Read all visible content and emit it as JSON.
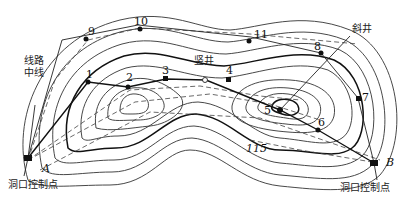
{
  "diagram": {
    "type": "topographic tunnel control survey",
    "labels": {
      "route_centerline": [
        "线路",
        "中线"
      ],
      "inclined_shaft": "斜井",
      "vertical_shaft": "竖井",
      "portal_control_point_left": "洞口控制点",
      "portal_control_point_right": "洞口控制点",
      "contour_elevation": "115"
    },
    "portal_points": [
      {
        "id": "A",
        "label": "A"
      },
      {
        "id": "B",
        "label": "B"
      }
    ],
    "control_points": [
      {
        "id": "1",
        "label": "1"
      },
      {
        "id": "2",
        "label": "2"
      },
      {
        "id": "3",
        "label": "3"
      },
      {
        "id": "4",
        "label": "4"
      },
      {
        "id": "5",
        "label": "5"
      },
      {
        "id": "6",
        "label": "6"
      },
      {
        "id": "7",
        "label": "7"
      },
      {
        "id": "8",
        "label": "8"
      },
      {
        "id": "9",
        "label": "9"
      },
      {
        "id": "10",
        "label": "10"
      },
      {
        "id": "11",
        "label": "11"
      }
    ],
    "traverse_main": [
      "A",
      "1",
      "2",
      "3",
      "4",
      "5",
      "6",
      "B"
    ],
    "traverse_outer": [
      "A",
      "9",
      "10",
      "11",
      "8",
      "7",
      "B"
    ]
  }
}
